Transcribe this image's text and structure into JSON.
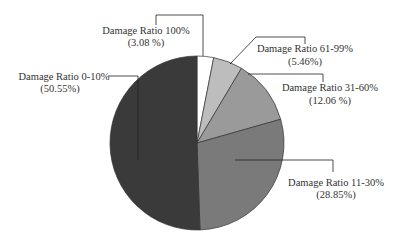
{
  "chart_data": {
    "type": "pie",
    "title": "",
    "categories": [
      "Damage Ratio 0-10%",
      "Damage Ratio 11-30%",
      "Damage Ratio 31-60%",
      "Damage Ratio 61-99%",
      "Damage Ratio 100%"
    ],
    "values": [
      50.55,
      28.85,
      12.06,
      5.46,
      3.08
    ],
    "labels": [
      {
        "name": "Damage Ratio 0-10%",
        "pct": "(50.55%)"
      },
      {
        "name": "Damage Ratio 11-30%",
        "pct": "(28.85%)"
      },
      {
        "name": "Damage Ratio 31-60%",
        "pct": "(12.06 %)"
      },
      {
        "name": "Damage Ratio 61-99%",
        "pct": "(5.46%)"
      },
      {
        "name": "Damage Ratio 100%",
        "pct": "(3.08 %)"
      }
    ],
    "colors": [
      "#3a3a3a",
      "#7a7a7a",
      "#9a9a9a",
      "#bdbdbd",
      "#ffffff"
    ],
    "legend": "callout labels"
  }
}
